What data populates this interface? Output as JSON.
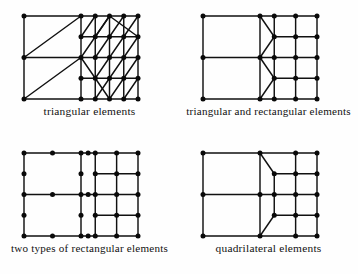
{
  "figure": {
    "background_color": "#fefefe",
    "line_color": "#111111",
    "node_color": "#0a0a0a",
    "panel_count": 4
  },
  "panels": [
    {
      "id": "triangular",
      "position": "top-left",
      "caption": "triangular elements",
      "element_type": "triangle",
      "geometry": {
        "origin": [
          24,
          16
        ],
        "width": 114,
        "height": 83,
        "coarse_columns": 2,
        "coarse_rows": 2,
        "fine_columns": 4,
        "fine_rows": 4
      },
      "nodes": [
        [
          0,
          0
        ],
        [
          0.5,
          0
        ],
        [
          0.75,
          0
        ],
        [
          1,
          0
        ],
        [
          0,
          0.5
        ],
        [
          0.5,
          0.5
        ],
        [
          0.75,
          0.5
        ],
        [
          1,
          0.5
        ],
        [
          0,
          1
        ],
        [
          0.5,
          1
        ],
        [
          0.75,
          1
        ],
        [
          1,
          1
        ],
        [
          0.5,
          0.25
        ],
        [
          0.75,
          0.25
        ],
        [
          1,
          0.25
        ],
        [
          0.5,
          0.75
        ],
        [
          0.75,
          0.75
        ],
        [
          1,
          0.75
        ],
        [
          0.625,
          0.25
        ],
        [
          0.875,
          0.25
        ],
        [
          0.625,
          0
        ],
        [
          0.875,
          0
        ],
        [
          0.625,
          0.5
        ],
        [
          0.875,
          0.5
        ],
        [
          0.625,
          0.75
        ],
        [
          0.875,
          0.75
        ],
        [
          0.625,
          1
        ],
        [
          0.875,
          1
        ]
      ],
      "edges": [
        {
          "from": [
            0,
            0
          ],
          "to": [
            1,
            0
          ],
          "kind": "horizontal"
        },
        {
          "from": [
            0,
            0.5
          ],
          "to": [
            1,
            0.5
          ],
          "kind": "horizontal"
        },
        {
          "from": [
            0,
            1
          ],
          "to": [
            1,
            1
          ],
          "kind": "horizontal"
        },
        {
          "from": [
            0.5,
            0.25
          ],
          "to": [
            1,
            0.25
          ],
          "kind": "horizontal"
        },
        {
          "from": [
            0.5,
            0.75
          ],
          "to": [
            1,
            0.75
          ],
          "kind": "horizontal"
        },
        {
          "from": [
            0,
            0
          ],
          "to": [
            0,
            1
          ],
          "kind": "vertical"
        },
        {
          "from": [
            0.5,
            0
          ],
          "to": [
            0.5,
            1
          ],
          "kind": "vertical"
        },
        {
          "from": [
            0.75,
            0
          ],
          "to": [
            0.75,
            1
          ],
          "kind": "vertical"
        },
        {
          "from": [
            1,
            0
          ],
          "to": [
            1,
            1
          ],
          "kind": "vertical"
        },
        {
          "from": [
            0.625,
            0
          ],
          "to": [
            0.625,
            0.5
          ],
          "kind": "vertical"
        },
        {
          "from": [
            0.875,
            0
          ],
          "to": [
            0.875,
            0.5
          ],
          "kind": "vertical"
        },
        {
          "from": [
            0.625,
            0.5
          ],
          "to": [
            0.625,
            1
          ],
          "kind": "vertical"
        },
        {
          "from": [
            0.875,
            0.5
          ],
          "to": [
            0.875,
            1
          ],
          "kind": "vertical"
        },
        {
          "from": [
            0,
            0.5
          ],
          "to": [
            0.5,
            0
          ],
          "kind": "diagonal"
        },
        {
          "from": [
            0,
            1
          ],
          "to": [
            0.5,
            0.5
          ],
          "kind": "diagonal"
        },
        {
          "from": [
            0.5,
            0.5
          ],
          "to": [
            0.75,
            0
          ],
          "kind": "diagonal"
        },
        {
          "from": [
            0.5,
            0.5
          ],
          "to": [
            0.75,
            1
          ],
          "kind": "diagonal"
        },
        {
          "from": [
            0.5,
            0.25
          ],
          "to": [
            0.625,
            0
          ],
          "kind": "diagonal"
        },
        {
          "from": [
            0.75,
            0.25
          ],
          "to": [
            0.875,
            0
          ],
          "kind": "diagonal"
        },
        {
          "from": [
            0.75,
            0
          ],
          "to": [
            1,
            0.25
          ],
          "kind": "diagonal"
        },
        {
          "from": [
            0.625,
            0.25
          ],
          "to": [
            0.75,
            0
          ],
          "kind": "diagonal"
        },
        {
          "from": [
            0.875,
            0.25
          ],
          "to": [
            1,
            0
          ],
          "kind": "diagonal"
        },
        {
          "from": [
            0.75,
            0.5
          ],
          "to": [
            0.875,
            0.25
          ],
          "kind": "diagonal"
        },
        {
          "from": [
            0.875,
            0.5
          ],
          "to": [
            1,
            0.25
          ],
          "kind": "diagonal"
        },
        {
          "from": [
            0.625,
            0.5
          ],
          "to": [
            0.75,
            0.25
          ],
          "kind": "diagonal"
        },
        {
          "from": [
            0.75,
            0.75
          ],
          "to": [
            0.875,
            0.5
          ],
          "kind": "diagonal"
        },
        {
          "from": [
            0.875,
            0.75
          ],
          "to": [
            1,
            0.5
          ],
          "kind": "diagonal"
        },
        {
          "from": [
            0.625,
            0.75
          ],
          "to": [
            0.75,
            0.5
          ],
          "kind": "diagonal"
        },
        {
          "from": [
            0.75,
            1
          ],
          "to": [
            0.875,
            0.75
          ],
          "kind": "diagonal"
        },
        {
          "from": [
            0.875,
            1
          ],
          "to": [
            1,
            0.75
          ],
          "kind": "diagonal"
        },
        {
          "from": [
            0.625,
            1
          ],
          "to": [
            0.75,
            0.75
          ],
          "kind": "diagonal"
        }
      ]
    },
    {
      "id": "triangular-and-rectangular",
      "position": "top-right",
      "caption": "triangular and rectangular elements",
      "element_type": "triangle+rectangle",
      "geometry": {
        "origin": [
          24,
          16
        ],
        "width": 114,
        "height": 83,
        "coarse_columns": 2,
        "coarse_rows": 2,
        "fine_columns": 4,
        "fine_rows": 4
      },
      "nodes": [
        [
          0,
          0
        ],
        [
          0.5,
          0
        ],
        [
          0.625,
          0
        ],
        [
          0.8125,
          0
        ],
        [
          1,
          0
        ],
        [
          0,
          0.5
        ],
        [
          0.5,
          0.5
        ],
        [
          0.625,
          0.5
        ],
        [
          0.8125,
          0.5
        ],
        [
          1,
          0.5
        ],
        [
          0,
          1
        ],
        [
          0.5,
          1
        ],
        [
          0.625,
          1
        ],
        [
          0.8125,
          1
        ],
        [
          1,
          1
        ],
        [
          0.625,
          0.25
        ],
        [
          0.8125,
          0.25
        ],
        [
          1,
          0.25
        ],
        [
          0.625,
          0.75
        ],
        [
          0.8125,
          0.75
        ],
        [
          1,
          0.75
        ]
      ],
      "edges": [
        {
          "from": [
            0,
            0
          ],
          "to": [
            1,
            0
          ],
          "kind": "horizontal"
        },
        {
          "from": [
            0,
            0.5
          ],
          "to": [
            1,
            0.5
          ],
          "kind": "horizontal"
        },
        {
          "from": [
            0,
            1
          ],
          "to": [
            1,
            1
          ],
          "kind": "horizontal"
        },
        {
          "from": [
            0.625,
            0.25
          ],
          "to": [
            1,
            0.25
          ],
          "kind": "horizontal"
        },
        {
          "from": [
            0.625,
            0.75
          ],
          "to": [
            1,
            0.75
          ],
          "kind": "horizontal"
        },
        {
          "from": [
            0,
            0
          ],
          "to": [
            0,
            1
          ],
          "kind": "vertical"
        },
        {
          "from": [
            0.5,
            0
          ],
          "to": [
            0.5,
            1
          ],
          "kind": "vertical"
        },
        {
          "from": [
            0.625,
            0
          ],
          "to": [
            0.625,
            1
          ],
          "kind": "vertical"
        },
        {
          "from": [
            0.8125,
            0
          ],
          "to": [
            0.8125,
            1
          ],
          "kind": "vertical"
        },
        {
          "from": [
            1,
            0
          ],
          "to": [
            1,
            1
          ],
          "kind": "vertical"
        },
        {
          "from": [
            0.5,
            0
          ],
          "to": [
            0.625,
            0.25
          ],
          "kind": "diagonal"
        },
        {
          "from": [
            0.5,
            0.5
          ],
          "to": [
            0.625,
            0.25
          ],
          "kind": "diagonal"
        },
        {
          "from": [
            0.5,
            0.5
          ],
          "to": [
            0.625,
            0.75
          ],
          "kind": "diagonal"
        },
        {
          "from": [
            0.5,
            1
          ],
          "to": [
            0.625,
            0.75
          ],
          "kind": "diagonal"
        }
      ]
    },
    {
      "id": "two-types-of-rectangular",
      "position": "bottom-left",
      "caption": "two types of rectangular elements",
      "element_type": "rectangle (quadratic + linear)",
      "geometry": {
        "origin": [
          24,
          16
        ],
        "width": 114,
        "height": 83,
        "coarse_columns": 2,
        "coarse_rows": 2,
        "fine_columns": 4,
        "fine_rows": 4
      },
      "nodes": [
        [
          0,
          0
        ],
        [
          0.25,
          0
        ],
        [
          0.5,
          0
        ],
        [
          0.5625,
          0
        ],
        [
          0.625,
          0
        ],
        [
          0.8125,
          0
        ],
        [
          1,
          0
        ],
        [
          0,
          0.25
        ],
        [
          0.5,
          0.25
        ],
        [
          0.625,
          0.25
        ],
        [
          0.8125,
          0.25
        ],
        [
          1,
          0.25
        ],
        [
          0,
          0.5
        ],
        [
          0.25,
          0.5
        ],
        [
          0.5,
          0.5
        ],
        [
          0.5625,
          0.5
        ],
        [
          0.625,
          0.5
        ],
        [
          0.8125,
          0.5
        ],
        [
          1,
          0.5
        ],
        [
          0,
          0.75
        ],
        [
          0.5,
          0.75
        ],
        [
          0.625,
          0.75
        ],
        [
          0.8125,
          0.75
        ],
        [
          1,
          0.75
        ],
        [
          0,
          1
        ],
        [
          0.25,
          1
        ],
        [
          0.5,
          1
        ],
        [
          0.5625,
          1
        ],
        [
          0.625,
          1
        ],
        [
          0.8125,
          1
        ],
        [
          1,
          1
        ]
      ],
      "edges": [
        {
          "from": [
            0,
            0
          ],
          "to": [
            1,
            0
          ],
          "kind": "horizontal"
        },
        {
          "from": [
            0,
            0.5
          ],
          "to": [
            1,
            0.5
          ],
          "kind": "horizontal"
        },
        {
          "from": [
            0,
            1
          ],
          "to": [
            1,
            1
          ],
          "kind": "horizontal"
        },
        {
          "from": [
            0.625,
            0.25
          ],
          "to": [
            1,
            0.25
          ],
          "kind": "horizontal"
        },
        {
          "from": [
            0.625,
            0.75
          ],
          "to": [
            1,
            0.75
          ],
          "kind": "horizontal"
        },
        {
          "from": [
            0,
            0
          ],
          "to": [
            0,
            1
          ],
          "kind": "vertical"
        },
        {
          "from": [
            0.5,
            0
          ],
          "to": [
            0.5,
            1
          ],
          "kind": "vertical"
        },
        {
          "from": [
            0.625,
            0
          ],
          "to": [
            0.625,
            1
          ],
          "kind": "vertical"
        },
        {
          "from": [
            0.8125,
            0
          ],
          "to": [
            0.8125,
            1
          ],
          "kind": "vertical"
        },
        {
          "from": [
            1,
            0
          ],
          "to": [
            1,
            1
          ],
          "kind": "vertical"
        }
      ]
    },
    {
      "id": "quadrilateral",
      "position": "bottom-right",
      "caption": "quadrilateral elements",
      "element_type": "quadrilateral",
      "geometry": {
        "origin": [
          24,
          16
        ],
        "width": 114,
        "height": 83,
        "coarse_columns": 2,
        "coarse_rows": 2,
        "fine_columns": 4,
        "fine_rows": 4
      },
      "nodes": [
        [
          0,
          0
        ],
        [
          0.5,
          0
        ],
        [
          0.8125,
          0
        ],
        [
          1,
          0
        ],
        [
          0,
          0.5
        ],
        [
          0.5,
          0.5
        ],
        [
          0.625,
          0.5
        ],
        [
          0.8125,
          0.5
        ],
        [
          1,
          0.5
        ],
        [
          0,
          1
        ],
        [
          0.5,
          1
        ],
        [
          0.8125,
          1
        ],
        [
          1,
          1
        ],
        [
          0.625,
          0.25
        ],
        [
          0.8125,
          0.25
        ],
        [
          1,
          0.25
        ],
        [
          0.625,
          0.75
        ],
        [
          0.8125,
          0.75
        ],
        [
          1,
          0.75
        ]
      ],
      "edges": [
        {
          "from": [
            0,
            0
          ],
          "to": [
            1,
            0
          ],
          "kind": "horizontal"
        },
        {
          "from": [
            0,
            0.5
          ],
          "to": [
            1,
            0.5
          ],
          "kind": "horizontal"
        },
        {
          "from": [
            0,
            1
          ],
          "to": [
            1,
            1
          ],
          "kind": "horizontal"
        },
        {
          "from": [
            0.625,
            0.25
          ],
          "to": [
            1,
            0.25
          ],
          "kind": "horizontal"
        },
        {
          "from": [
            0.625,
            0.75
          ],
          "to": [
            1,
            0.75
          ],
          "kind": "horizontal"
        },
        {
          "from": [
            0,
            0
          ],
          "to": [
            0,
            1
          ],
          "kind": "vertical"
        },
        {
          "from": [
            0.5,
            0
          ],
          "to": [
            0.5,
            1
          ],
          "kind": "vertical"
        },
        {
          "from": [
            0.8125,
            0
          ],
          "to": [
            0.8125,
            1
          ],
          "kind": "vertical"
        },
        {
          "from": [
            1,
            0
          ],
          "to": [
            1,
            1
          ],
          "kind": "vertical"
        },
        {
          "from": [
            0.625,
            0.25
          ],
          "to": [
            0.625,
            0.75
          ],
          "kind": "vertical"
        },
        {
          "from": [
            0.5,
            0
          ],
          "to": [
            0.625,
            0.25
          ],
          "kind": "diagonal"
        },
        {
          "from": [
            0.5,
            1
          ],
          "to": [
            0.625,
            0.75
          ],
          "kind": "diagonal"
        }
      ]
    }
  ],
  "style": {
    "edge_stroke_width": 1.45,
    "node_radius": 2.5,
    "caption_font_size": 11.4
  }
}
